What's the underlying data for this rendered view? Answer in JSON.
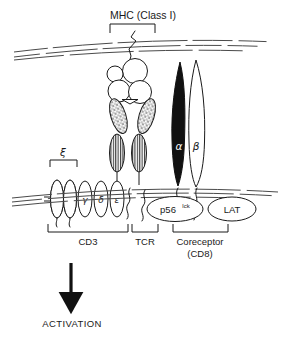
{
  "figure": {
    "title_label": "MHC (Class I)",
    "activation_label": "ACTIVATION",
    "groups": {
      "cd3": "CD3",
      "tcr": "TCR",
      "coreceptor_line1": "Coreceptor",
      "coreceptor_line2": "(CD8)"
    },
    "chains": {
      "zeta": "ξ",
      "gamma": "γ",
      "delta": "δ",
      "epsilon": "ε",
      "alpha": "α",
      "beta": "β"
    },
    "enzymes": {
      "lck_base": "p56",
      "lck_sup": "lck",
      "lat": "LAT"
    },
    "colors": {
      "ink": "#1a1a1a",
      "membrane": "#4a4a4a",
      "fill_black": "#111111",
      "background": "#ffffff"
    }
  }
}
